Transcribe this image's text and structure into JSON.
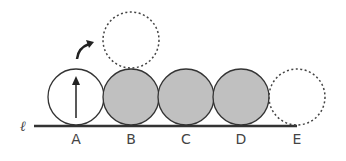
{
  "diagram": {
    "line_label": "ℓ",
    "circles": [
      {
        "label": "A",
        "style": "outline",
        "has_arrow": true
      },
      {
        "label": "B",
        "style": "shaded"
      },
      {
        "label": "C",
        "style": "shaded"
      },
      {
        "label": "D",
        "style": "shaded"
      },
      {
        "label": "E",
        "style": "dashed"
      }
    ],
    "extra_dashed_circle_above": "B",
    "colors": {
      "shaded": "#c0c0c0",
      "stroke": "#333333"
    }
  }
}
